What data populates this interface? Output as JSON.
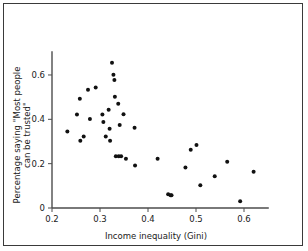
{
  "figure": {
    "background_color": "#ffffff",
    "frame_color": "#3a3a3a",
    "axis_color": "#4d4d4d",
    "point_color": "#111111"
  },
  "chart_data": {
    "type": "scatter",
    "title": "",
    "xlabel": "Income inequality (Gini)",
    "ylabel": "Percentage saying \"Most people can be trusted\"",
    "ylabel_line1": "Percentage saying \"Most people",
    "ylabel_line2": "can be trusted\"",
    "xlim": [
      0.2,
      0.635
    ],
    "ylim": [
      0.0,
      0.68
    ],
    "xticks": [
      0.2,
      0.3,
      0.4,
      0.5,
      0.6
    ],
    "xticklabels": [
      "0.2",
      "0.3",
      "0.4",
      "0.5",
      "0.6"
    ],
    "yticks": [
      0,
      0.2,
      0.4,
      0.6
    ],
    "yticklabels": [
      "0",
      "0.2",
      "0.4",
      "0.6"
    ],
    "grid": false,
    "legend": null,
    "marker": "filled-circle",
    "marker_size_px": 4,
    "points": [
      {
        "x": 0.232,
        "y": 0.345
      },
      {
        "x": 0.252,
        "y": 0.422
      },
      {
        "x": 0.258,
        "y": 0.493
      },
      {
        "x": 0.259,
        "y": 0.303
      },
      {
        "x": 0.266,
        "y": 0.323
      },
      {
        "x": 0.275,
        "y": 0.533
      },
      {
        "x": 0.279,
        "y": 0.401
      },
      {
        "x": 0.291,
        "y": 0.543
      },
      {
        "x": 0.305,
        "y": 0.422
      },
      {
        "x": 0.307,
        "y": 0.388
      },
      {
        "x": 0.312,
        "y": 0.323
      },
      {
        "x": 0.318,
        "y": 0.443
      },
      {
        "x": 0.32,
        "y": 0.358
      },
      {
        "x": 0.321,
        "y": 0.303
      },
      {
        "x": 0.325,
        "y": 0.655
      },
      {
        "x": 0.328,
        "y": 0.601
      },
      {
        "x": 0.33,
        "y": 0.577
      },
      {
        "x": 0.331,
        "y": 0.502
      },
      {
        "x": 0.333,
        "y": 0.233
      },
      {
        "x": 0.338,
        "y": 0.47
      },
      {
        "x": 0.339,
        "y": 0.233
      },
      {
        "x": 0.341,
        "y": 0.374
      },
      {
        "x": 0.344,
        "y": 0.233
      },
      {
        "x": 0.349,
        "y": 0.423
      },
      {
        "x": 0.354,
        "y": 0.222
      },
      {
        "x": 0.372,
        "y": 0.362
      },
      {
        "x": 0.373,
        "y": 0.192
      },
      {
        "x": 0.42,
        "y": 0.222
      },
      {
        "x": 0.442,
        "y": 0.062
      },
      {
        "x": 0.447,
        "y": 0.057
      },
      {
        "x": 0.449,
        "y": 0.057
      },
      {
        "x": 0.478,
        "y": 0.183
      },
      {
        "x": 0.489,
        "y": 0.263
      },
      {
        "x": 0.501,
        "y": 0.284
      },
      {
        "x": 0.509,
        "y": 0.103
      },
      {
        "x": 0.539,
        "y": 0.143
      },
      {
        "x": 0.565,
        "y": 0.209
      },
      {
        "x": 0.592,
        "y": 0.031
      },
      {
        "x": 0.62,
        "y": 0.163
      }
    ]
  }
}
